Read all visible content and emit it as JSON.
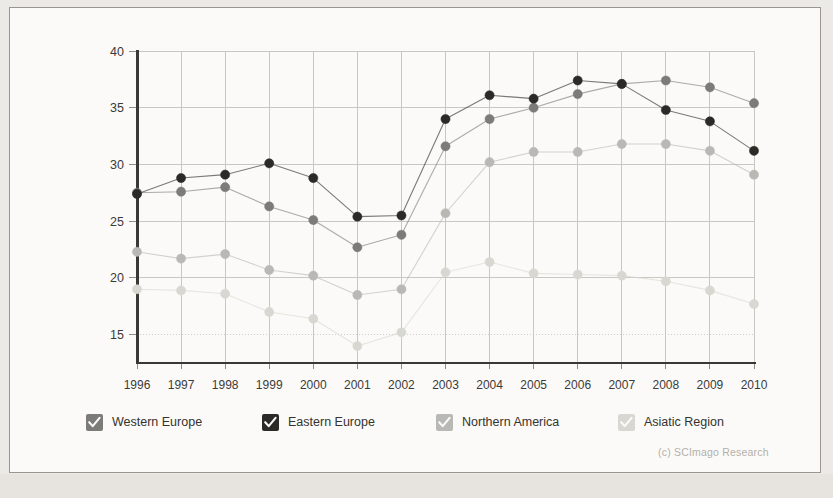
{
  "credit": "(c) SCImago Research",
  "legend": {
    "items": [
      {
        "label": "Western Europe",
        "color": "#7b7b78",
        "swatch": "checkbox-checked-icon",
        "x": 0
      },
      {
        "label": "Eastern Europe",
        "color": "#2b2a27",
        "swatch": "checkbox-checked-icon",
        "x": 176
      },
      {
        "label": "Northern America",
        "color": "#b8b8b4",
        "swatch": "checkbox-checked-icon",
        "x": 350
      },
      {
        "label": "Asiatic Region",
        "color": "#d8d8d2",
        "swatch": "checkbox-checked-icon",
        "x": 532
      }
    ]
  },
  "chart_data": {
    "type": "line",
    "title": "",
    "subtitle": "",
    "xlabel": "",
    "ylabel": "",
    "grid": true,
    "legend_position": "bottom",
    "xlim": [
      1996,
      2010
    ],
    "ylim": [
      12.5,
      40
    ],
    "yticks": [
      15,
      20,
      25,
      30,
      35,
      40
    ],
    "ytick_labels": [
      "15",
      "20",
      "25",
      "30",
      "35",
      "40"
    ],
    "x": [
      1996,
      1997,
      1998,
      1999,
      2000,
      2001,
      2002,
      2003,
      2004,
      2005,
      2006,
      2007,
      2008,
      2009,
      2010
    ],
    "xtick_labels": [
      "1996",
      "1997",
      "1998",
      "1999",
      "2000",
      "2001",
      "2002",
      "2003",
      "2004",
      "2005",
      "2006",
      "2007",
      "2008",
      "2009",
      "2010"
    ],
    "series": [
      {
        "name": "Western Europe",
        "color": "#7b7b78",
        "values": [
          27.5,
          27.6,
          28.0,
          26.3,
          25.1,
          22.7,
          23.8,
          31.6,
          34.0,
          35.0,
          36.2,
          37.1,
          37.4,
          36.8,
          35.4
        ]
      },
      {
        "name": "Eastern Europe",
        "color": "#2b2a27",
        "values": [
          27.4,
          28.8,
          29.1,
          30.1,
          28.8,
          25.4,
          25.5,
          34.0,
          36.1,
          35.8,
          37.4,
          37.1,
          34.8,
          33.8,
          31.2
        ]
      },
      {
        "name": "Northern America",
        "color": "#b8b8b4",
        "values": [
          22.3,
          21.7,
          22.1,
          20.7,
          20.2,
          18.5,
          19.0,
          25.7,
          30.2,
          31.1,
          31.1,
          31.8,
          31.8,
          31.2,
          29.1
        ]
      },
      {
        "name": "Asiatic Region",
        "color": "#d8d8d2",
        "values": [
          19.0,
          18.9,
          18.6,
          17.0,
          16.4,
          14.0,
          15.2,
          20.5,
          21.4,
          20.4,
          20.3,
          20.2,
          19.7,
          18.9,
          17.7
        ]
      }
    ]
  }
}
